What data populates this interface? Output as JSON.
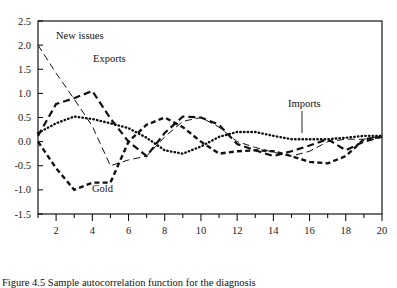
{
  "figure": {
    "caption": "Figure 4.5  Sample autocorrelation function for the diagnosis",
    "background": "#ffffff",
    "ink_color": "#111111"
  },
  "chart_data": {
    "type": "line",
    "title": "",
    "xlabel": "",
    "ylabel": "",
    "xlim": [
      1,
      20
    ],
    "ylim": [
      -1.5,
      2.5
    ],
    "grid": false,
    "legend_position": "bottom",
    "y_ticks": [
      "2.5",
      "2.0",
      "1.5",
      "1.0",
      "0.5",
      "0.0",
      "-0.5",
      "-1.0",
      "-1.5"
    ],
    "y_tick_values": [
      2.5,
      2.0,
      1.5,
      1.0,
      0.5,
      0.0,
      -0.5,
      -1.0,
      -1.5
    ],
    "x_ticks": [
      "2",
      "4",
      "6",
      "8",
      "10",
      "12",
      "14",
      "16",
      "18",
      "20"
    ],
    "x_tick_values": [
      2,
      4,
      6,
      8,
      10,
      12,
      14,
      16,
      18,
      20
    ],
    "x_minor_ticks": [
      1,
      3,
      5,
      7,
      9,
      11,
      13,
      15,
      17,
      19
    ],
    "x": [
      1,
      2,
      3,
      4,
      5,
      6,
      7,
      8,
      9,
      10,
      11,
      12,
      13,
      14,
      15,
      16,
      17,
      18,
      19,
      20
    ],
    "series": [
      {
        "name": "New issues",
        "style": "long-dash",
        "linewidth": 1.0,
        "values": [
          2.0,
          1.42,
          0.88,
          0.32,
          -0.5,
          -0.38,
          -0.3,
          0.1,
          0.42,
          0.5,
          0.3,
          0.0,
          -0.12,
          -0.22,
          -0.3,
          -0.2,
          0.0,
          0.05,
          0.05,
          0.12
        ]
      },
      {
        "name": "Exports",
        "style": "dash",
        "linewidth": 2.2,
        "values": [
          0.12,
          0.78,
          0.9,
          1.05,
          0.48,
          0.0,
          -0.3,
          0.18,
          0.52,
          0.5,
          0.35,
          -0.05,
          -0.18,
          -0.3,
          -0.2,
          -0.08,
          0.05,
          -0.18,
          0.0,
          0.1
        ]
      },
      {
        "name": "Imports",
        "style": "dotted",
        "linewidth": 2.4,
        "values": [
          0.18,
          0.38,
          0.52,
          0.47,
          0.38,
          0.28,
          0.08,
          -0.18,
          -0.25,
          -0.1,
          0.1,
          0.2,
          0.2,
          0.12,
          0.05,
          0.05,
          0.05,
          0.08,
          0.12,
          0.12
        ]
      },
      {
        "name": "Gold",
        "style": "dash-dot",
        "linewidth": 2.4,
        "values": [
          0.0,
          -0.55,
          -1.0,
          -0.85,
          -0.85,
          0.0,
          0.35,
          0.5,
          0.3,
          0.0,
          -0.25,
          -0.2,
          -0.18,
          -0.2,
          -0.3,
          -0.42,
          -0.45,
          -0.3,
          0.05,
          0.1
        ]
      }
    ],
    "annotations": [
      {
        "text": "New issues",
        "x_px": 56,
        "y_px": 39,
        "series": "New issues"
      },
      {
        "text": "Exports",
        "x_px": 93,
        "y_px": 62,
        "series": "Exports"
      },
      {
        "text": "Gold",
        "x_px": 92,
        "y_px": 192,
        "series": "Gold"
      },
      {
        "text": "Imports",
        "x_px": 288,
        "y_px": 107,
        "series": "Imports",
        "leader": true
      }
    ]
  },
  "legend": {
    "items": [
      {
        "label_line1": "New",
        "label_line2": "issues",
        "style": "long-dash"
      },
      {
        "label_line1": "Exports",
        "label_line2": "",
        "style": "dash"
      },
      {
        "label_line1": "Imports",
        "label_line2": "",
        "style": "dotted"
      },
      {
        "label_line1": "Gold",
        "label_line2": "",
        "style": "dash-dot"
      }
    ]
  }
}
